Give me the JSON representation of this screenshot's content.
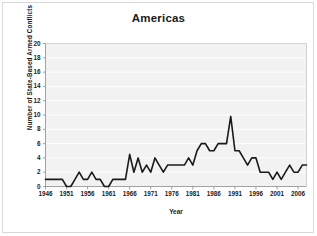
{
  "figure": {
    "title": "Americas",
    "background_color": "#ffffff",
    "frame_color": "#d9d9d9"
  },
  "chart_data": {
    "type": "line",
    "title": "Americas",
    "xlabel": "Year",
    "ylabel": "Number of State-Based Armed Conflicts",
    "xlim": [
      1946,
      2008
    ],
    "ylim": [
      0,
      20
    ],
    "ytick_step": 2,
    "xtick_step": 5,
    "grid": true,
    "grid_axis": "y",
    "legend": false,
    "line_color": "#1a1a1a",
    "plot_background_color": "#f2f2f2",
    "yticks": [
      0,
      2,
      4,
      6,
      8,
      10,
      12,
      14,
      16,
      18,
      20
    ],
    "xticks": [
      1946,
      1951,
      1956,
      1961,
      1966,
      1971,
      1976,
      1981,
      1986,
      1991,
      1996,
      2001,
      2006
    ],
    "x": [
      1946,
      1947,
      1948,
      1949,
      1950,
      1951,
      1952,
      1953,
      1954,
      1955,
      1956,
      1957,
      1958,
      1959,
      1960,
      1961,
      1962,
      1963,
      1964,
      1965,
      1966,
      1967,
      1968,
      1969,
      1970,
      1971,
      1972,
      1973,
      1974,
      1975,
      1976,
      1977,
      1978,
      1979,
      1980,
      1981,
      1982,
      1983,
      1984,
      1985,
      1986,
      1987,
      1988,
      1989,
      1990,
      1991,
      1992,
      1993,
      1994,
      1995,
      1996,
      1997,
      1998,
      1999,
      2000,
      2001,
      2002,
      2003,
      2004,
      2005,
      2006,
      2007,
      2008
    ],
    "values": [
      1,
      1,
      1,
      1,
      1,
      0,
      0,
      1,
      2,
      1,
      1,
      2,
      1,
      1,
      0,
      0,
      1,
      1,
      1,
      1,
      4.5,
      2,
      4,
      2,
      3,
      2,
      4,
      3,
      2,
      3,
      3,
      3,
      3,
      3,
      4,
      3,
      5,
      6,
      6,
      5,
      5,
      6,
      6,
      6,
      9.8,
      5,
      5,
      4,
      3,
      4,
      4,
      2,
      2,
      2,
      1,
      2,
      1,
      2,
      3,
      2,
      2,
      3,
      3
    ],
    "series": [
      {
        "name": "Americas",
        "values": [
          1,
          1,
          1,
          1,
          1,
          0,
          0,
          1,
          2,
          1,
          1,
          2,
          1,
          1,
          0,
          0,
          1,
          1,
          1,
          1,
          4.5,
          2,
          4,
          2,
          3,
          2,
          4,
          3,
          2,
          3,
          3,
          3,
          3,
          3,
          4,
          3,
          5,
          6,
          6,
          5,
          5,
          6,
          6,
          6,
          9.8,
          5,
          5,
          4,
          3,
          4,
          4,
          2,
          2,
          2,
          1,
          2,
          1,
          2,
          3,
          2,
          2,
          3,
          3
        ]
      }
    ]
  }
}
